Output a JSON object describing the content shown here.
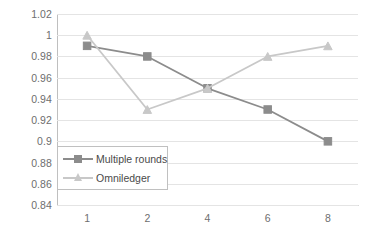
{
  "chart_data": {
    "type": "line",
    "title": "",
    "subtitle": "",
    "xlabel": "",
    "ylabel": "",
    "categories": [
      "1",
      "2",
      "4",
      "6",
      "8"
    ],
    "series": [
      {
        "name": "Multiple rounds",
        "values": [
          0.99,
          0.98,
          0.95,
          0.93,
          0.9
        ],
        "color": "#8c8c8c",
        "marker": "square"
      },
      {
        "name": "Omniledger",
        "values": [
          1.0,
          0.93,
          0.95,
          0.98,
          0.99
        ],
        "color": "#c8c8c8",
        "marker": "triangle"
      }
    ],
    "ylim": [
      0.84,
      1.02
    ],
    "ytick_step": 0.02,
    "ytick_labels": [
      "1.02",
      "1",
      "0.98",
      "0.96",
      "0.94",
      "0.92",
      "0.9",
      "0.88",
      "0.86",
      "0.84"
    ],
    "ytick_values": [
      1.02,
      1.0,
      0.98,
      0.96,
      0.94,
      0.92,
      0.9,
      0.88,
      0.86,
      0.84
    ],
    "grid": "horizontal",
    "legend_position": "inside-lower-left",
    "background": "#ffffff",
    "gridline_color": "#e4e4e4",
    "axis_color": "#bfbfbf",
    "tick_label_color": "#6e6e6e"
  },
  "legend": {
    "entries": [
      {
        "label": "Multiple rounds"
      },
      {
        "label": "Omniledger"
      }
    ]
  }
}
